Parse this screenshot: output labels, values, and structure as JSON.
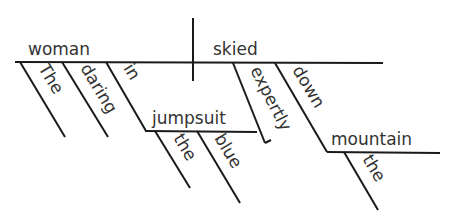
{
  "diagram": {
    "type": "sentence-diagram",
    "subject": "woman",
    "verb": "skied",
    "subject_modifiers": [
      "The",
      "daring",
      "in"
    ],
    "prepositional_phrase_1": {
      "preposition": "in",
      "object": "jumpsuit",
      "modifiers": [
        "the",
        "blue"
      ]
    },
    "verb_modifiers": [
      "expertly",
      "down"
    ],
    "prepositional_phrase_2": {
      "preposition": "down",
      "object": "mountain",
      "modifiers": [
        "the"
      ]
    },
    "colors": {
      "line": "#1a1a1a",
      "text": "#333333",
      "background": "#ffffff"
    }
  }
}
